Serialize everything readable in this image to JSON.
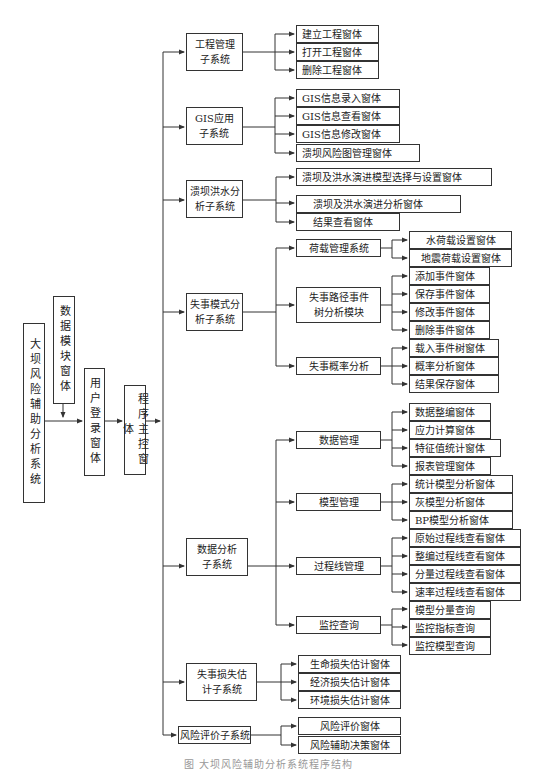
{
  "diagram": {
    "root": "大坝风险辅助分析系统",
    "data_module": "数据模块窗体",
    "login": "用户登录窗体",
    "main_control": "程序主控窗体",
    "subsystems": {
      "project": {
        "label": "工程管理\n子系统",
        "children": [
          "建立工程窗体",
          "打开工程窗体",
          "删除工程窗体"
        ]
      },
      "gis": {
        "label": "GIS应用\n子系统",
        "children": [
          "GIS信息录入窗体",
          "GIS信息查看窗体",
          "GIS信息修改窗体",
          "溃坝风险图管理窗体"
        ]
      },
      "flood": {
        "label": "溃坝洪水分\n析子系统",
        "children": [
          "溃坝及洪水演进模型选择与设置窗体",
          "溃坝及洪水演进分析窗体",
          "结果查看窗体"
        ]
      },
      "failure_mode": {
        "label": "失事模式分\n析子系统",
        "modules": {
          "load": {
            "label": "荷载管理系统",
            "children": [
              "水荷载设置窗体",
              "地震荷载设置窗体"
            ]
          },
          "event_tree": {
            "label": "失事路径事件\n树分析模块",
            "children": [
              "添加事件窗体",
              "保存事件窗体",
              "修改事件窗体",
              "删除事件窗体"
            ]
          },
          "probability": {
            "label": "失事概率分析",
            "children": [
              "载入事件树窗体",
              "概率分析窗体",
              "结果保存窗体"
            ]
          }
        }
      },
      "data_analysis": {
        "label": "数据分析\n子系统",
        "modules": {
          "data_mgmt": {
            "label": "数据管理",
            "children": [
              "数据整编窗体",
              "应力计算窗体",
              "特征值统计窗体",
              "报表管理窗体"
            ]
          },
          "model_mgmt": {
            "label": "模型管理",
            "children": [
              "统计模型分析窗体",
              "灰模型分析窗体",
              "BP模型分析窗体"
            ]
          },
          "process_line": {
            "label": "过程线管理",
            "children": [
              "原始过程线查看窗体",
              "整编过程线查看窗体",
              "分量过程线查看窗体",
              "速率过程线查看窗体"
            ]
          },
          "monitoring": {
            "label": "监控查询",
            "children": [
              "模型分量查询",
              "监控指标查询",
              "监控模型查询"
            ]
          }
        }
      },
      "loss": {
        "label": "失事损失估\n计子系统",
        "children": [
          "生命损失估计窗体",
          "经济损失估计窗体",
          "环境损失估计窗体"
        ]
      },
      "risk_eval": {
        "label": "风险评价子系统",
        "children": [
          "风险评价窗体",
          "风险辅助决策窗体"
        ]
      }
    },
    "caption": "图  大坝风险辅助分析系统程序结构"
  },
  "colors": {
    "line": "#333333",
    "box_border": "#333333",
    "background": "#ffffff"
  }
}
